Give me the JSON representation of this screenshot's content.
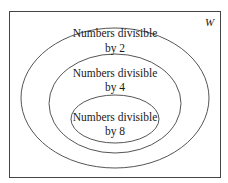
{
  "diagram": {
    "type": "venn-nested",
    "universe": {
      "label": "W",
      "frame": {
        "x": 9.5,
        "y": 11.5,
        "width": 211,
        "height": 166
      }
    },
    "sets": [
      {
        "id": "div2",
        "line1": "Numbers divisible",
        "line2": "by 2",
        "ellipse": {
          "cx": 115,
          "cy": 98,
          "rx": 94,
          "ry": 70
        },
        "text_y": [
          37,
          52
        ]
      },
      {
        "id": "div4",
        "line1": "Numbers divisible",
        "line2": "by 4",
        "ellipse": {
          "cx": 115,
          "cy": 103.5,
          "rx": 66,
          "ry": 49.5
        },
        "text_y": [
          77,
          91
        ]
      },
      {
        "id": "div8",
        "line1": "Numbers divisible",
        "line2": "by 8",
        "ellipse": {
          "cx": 115,
          "cy": 119,
          "rx": 44,
          "ry": 24
        },
        "text_y": [
          121,
          135
        ]
      }
    ],
    "relationships": "div8 ⊂ div4 ⊂ div2 ⊂ W"
  }
}
